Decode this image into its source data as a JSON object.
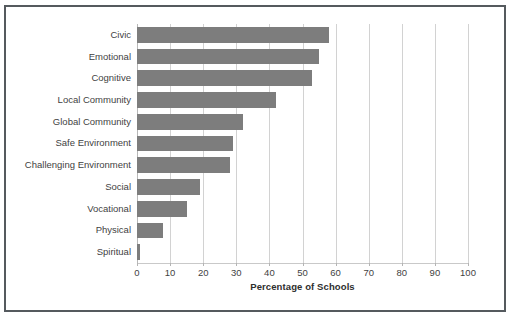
{
  "chart_data": {
    "type": "bar",
    "orientation": "horizontal",
    "title": "",
    "xlabel": "Percentage of Schools",
    "ylabel": "",
    "categories": [
      "Civic",
      "Emotional",
      "Cognitive",
      "Local Community",
      "Global Community",
      "Safe Environment",
      "Challenging Environment",
      "Social",
      "Vocational",
      "Physical",
      "Spiritual"
    ],
    "values": [
      58,
      55,
      53,
      42,
      32,
      29,
      28,
      19,
      15,
      8,
      1
    ],
    "xlim": [
      0,
      100
    ],
    "xticks": [
      0,
      10,
      20,
      30,
      40,
      50,
      60,
      70,
      80,
      90,
      100
    ],
    "xtick_labels": [
      "0",
      "10",
      "20",
      "30",
      "40",
      "50",
      "60",
      "70",
      "80",
      "90",
      "100"
    ],
    "grid": "vertical",
    "legend": "none",
    "bar_color": "#7d7d7d",
    "gridline_color": "#d2d2d2",
    "frame_color": "#555a5e",
    "text_color": "#3f3f3f"
  }
}
